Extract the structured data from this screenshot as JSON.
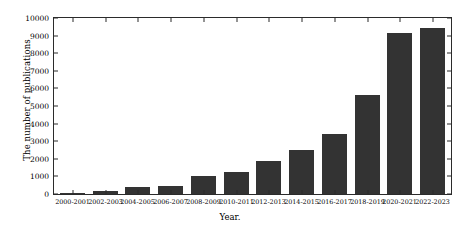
{
  "chart_data": {
    "type": "bar",
    "title": "",
    "xlabel": "Year.",
    "ylabel": "The number of publications",
    "categories": [
      "2000-2001",
      "2002-2003",
      "2004-2005",
      "2006-2007",
      "2008-2009",
      "2010-2011",
      "2012-2013",
      "2014-2015",
      "2016-2017",
      "2018-2019",
      "2020-2021",
      "2022-2023"
    ],
    "values": [
      60,
      150,
      400,
      480,
      1050,
      1250,
      1900,
      2500,
      3400,
      5600,
      9150,
      9450
    ],
    "ylim": [
      0,
      10000
    ],
    "yticks": [
      0,
      1000,
      2000,
      3000,
      4000,
      5000,
      6000,
      7000,
      8000,
      9000,
      10000
    ],
    "ytick_labels": [
      "0",
      "1000",
      "2000",
      "3000",
      "4000",
      "5000",
      "6000",
      "7000",
      "8000",
      "9000",
      "10000"
    ],
    "grid": false,
    "legend": null,
    "bar_color": "#333333",
    "axis_color": "#2b2b2b",
    "background": "#ffffff"
  }
}
